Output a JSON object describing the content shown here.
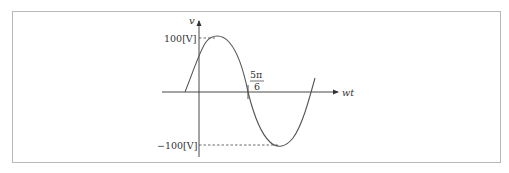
{
  "diagram": {
    "type": "sine-waveform",
    "axes": {
      "vertical_label": "v",
      "horizontal_label": "wt"
    },
    "labels": {
      "max": "100[V]",
      "min": "−100[V]",
      "zero_crossing_numerator": "5π",
      "zero_crossing_denominator": "6"
    },
    "colors": {
      "curve": "#555555",
      "axes": "#333333",
      "frame": "#b8b8b8"
    }
  }
}
